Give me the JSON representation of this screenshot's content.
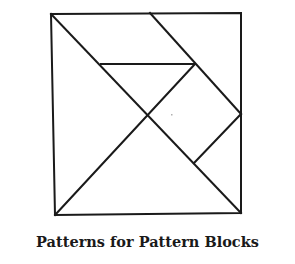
{
  "caption": "Patterns for Pattern Blocks",
  "colors": {
    "line": "#1a1a1a",
    "background": "#ffffff",
    "speck": "#b0b0b0"
  },
  "diagram": {
    "type": "tangram-square",
    "square": {
      "tl": [
        51,
        14
      ],
      "tr": [
        241,
        13
      ],
      "br": [
        241,
        213
      ],
      "bl": [
        55,
        215
      ]
    },
    "segments": [
      {
        "name": "main-diagonal",
        "from": [
          51,
          14
        ],
        "to": [
          241,
          213
        ]
      },
      {
        "name": "anti-diagonal",
        "from": [
          55,
          215
        ],
        "to": [
          195,
          64
        ]
      },
      {
        "name": "top-diagonal",
        "from": [
          150,
          13
        ],
        "to": [
          241,
          114
        ]
      },
      {
        "name": "horizontal-bar",
        "from": [
          101,
          64
        ],
        "to": [
          195,
          64
        ]
      },
      {
        "name": "short-segment",
        "from": [
          241,
          114
        ],
        "to": [
          194,
          163
        ]
      }
    ],
    "center": [
      148,
      115
    ]
  }
}
